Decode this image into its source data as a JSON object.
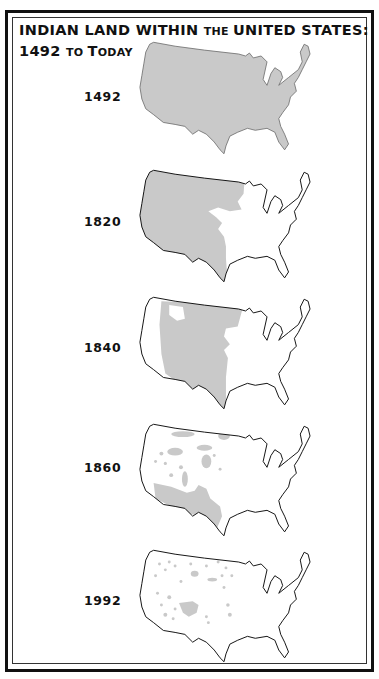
{
  "title": {
    "line1": [
      {
        "text": "INDIAN LAND WITHIN ",
        "style": "big"
      },
      {
        "text": "THE ",
        "style": "sc"
      },
      {
        "text": "UNITED STATES:",
        "style": "big"
      }
    ],
    "line2": [
      {
        "text": "1492 ",
        "style": "big"
      },
      {
        "text": "TO ",
        "style": "sc"
      },
      {
        "text": "T",
        "style": "big"
      },
      {
        "text": "ODAY",
        "style": "sc"
      }
    ]
  },
  "colors": {
    "indian_land_fill": "#c9c9c9",
    "outline": "#111111",
    "background": "#ffffff"
  },
  "maps": [
    {
      "year": "1492",
      "coverage": "entire contiguous United States"
    },
    {
      "year": "1820",
      "coverage": "western two-thirds, west of the Mississippi region"
    },
    {
      "year": "1840",
      "coverage": "central plains and interior west"
    },
    {
      "year": "1860",
      "coverage": "scattered western tracts and southwest"
    },
    {
      "year": "1992",
      "coverage": "small scattered reservations"
    }
  ]
}
